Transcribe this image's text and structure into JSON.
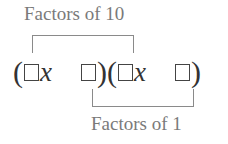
{
  "diagram": {
    "top_label": "Factors of 10",
    "bottom_label": "Factors of 1",
    "expression": {
      "open_paren_1": "(",
      "var_1": "x",
      "close_paren_1": ")",
      "open_paren_2": "(",
      "var_2": "x",
      "close_paren_2": ")"
    },
    "connections": [
      {
        "label": "Factors of 10",
        "links": [
          "first-coefficient-box",
          "third-coefficient-box"
        ]
      },
      {
        "label": "Factors of 1",
        "links": [
          "first-constant-box",
          "second-constant-box"
        ]
      }
    ]
  }
}
